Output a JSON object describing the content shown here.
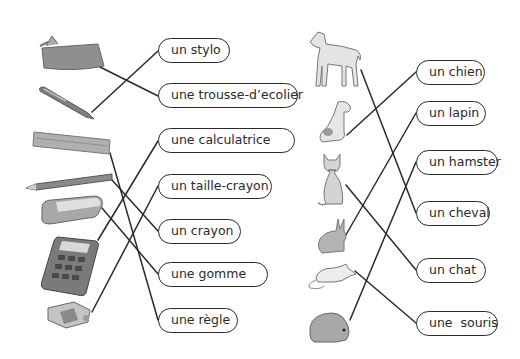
{
  "worksheet": {
    "left_column": {
      "labels": [
        {
          "text": "un stylo"
        },
        {
          "text": "une trousse-d’ecolier"
        },
        {
          "text": "une calculatrice"
        },
        {
          "text": "un taille-crayon"
        },
        {
          "text": "un crayon"
        },
        {
          "text": "une gomme"
        },
        {
          "text": "une règle"
        }
      ],
      "pictures": [
        "pencil-case-icon",
        "pen-icon",
        "ruler-icon",
        "pencil-icon",
        "eraser-icon",
        "calculator-icon",
        "sharpener-icon"
      ]
    },
    "right_column": {
      "labels": [
        {
          "text": "un chien"
        },
        {
          "text": "un lapin"
        },
        {
          "text": "un hamster"
        },
        {
          "text": "un cheval"
        },
        {
          "text": "un chat"
        },
        {
          "text": "une  souris"
        }
      ],
      "pictures": [
        "horse-icon",
        "dog-icon",
        "cat-icon",
        "rabbit-icon",
        "mouse-icon",
        "hamster-icon"
      ]
    },
    "colors": {
      "line": "#2a2a2a",
      "box_border": "#2a2a2a",
      "picture_fill": "#9a9a9a",
      "picture_light": "#d8d8d8",
      "background": "#ffffff"
    }
  }
}
